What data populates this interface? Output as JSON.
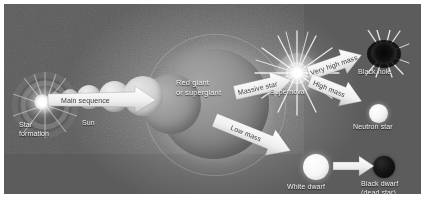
{
  "figure": {
    "type": "stellar-evolution-diagram",
    "background_color": "#6e6e6e",
    "label_color": "#f2f2f2",
    "arrow_color": "#f0f0f0",
    "arrow_text_color": "#3a3a3a"
  },
  "stages": {
    "star_formation": "Star\nformation",
    "sun": "Sun",
    "red_giant": "Red giant\nor supergiant",
    "supernova": "Supernova",
    "black_hole": "Black hole",
    "neutron_star": "Neutron star",
    "white_dwarf": "White dwarf",
    "black_dwarf": "Black dwarf\n(dead star)"
  },
  "arrows": {
    "main_sequence": "Main sequence",
    "massive_star": "Massive star",
    "very_high_mass": "Very high mass",
    "high_mass": "High mass",
    "low_mass": "Low mass"
  }
}
